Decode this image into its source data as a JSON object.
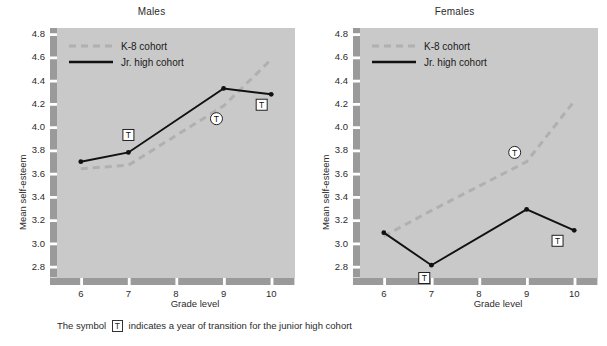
{
  "figure": {
    "caption_before": "The symbol",
    "caption_symbol": "T",
    "caption_after": "indicates a year of transition for the junior high cohort"
  },
  "colors": {
    "plot_background": "#c9c9c9",
    "axis_band": "#9a9a9a",
    "k8_line": "#b0b0b0",
    "jrhigh_line": "#111111",
    "text": "#2b2b2b"
  },
  "chart_data": [
    {
      "type": "line",
      "title": "Males",
      "xlabel": "Grade level",
      "ylabel": "Mean self-esteem",
      "x": [
        6,
        7,
        8,
        9,
        10
      ],
      "xtick_labels": [
        "6",
        "7",
        "8",
        "9",
        "10"
      ],
      "xlim": [
        5.5,
        10.5
      ],
      "ylim": [
        2.7,
        4.85
      ],
      "ytick_labels": [
        "2.8",
        "3.0",
        "3.2",
        "3.4",
        "3.6",
        "3.8",
        "4.0",
        "4.2",
        "4.4",
        "4.6",
        "4.8"
      ],
      "yticks": [
        2.8,
        3.0,
        3.2,
        3.4,
        3.6,
        3.8,
        4.0,
        4.2,
        4.4,
        4.6,
        4.8
      ],
      "grid": false,
      "legend_position": "upper-left",
      "series": [
        {
          "name": "K-8 cohort",
          "style": "dashed",
          "color": "#b0b0b0",
          "markers": false,
          "x": [
            6,
            7,
            9,
            10
          ],
          "values": [
            3.64,
            3.67,
            4.18,
            4.58
          ]
        },
        {
          "name": "Jr. high cohort",
          "style": "solid",
          "color": "#111111",
          "markers": true,
          "x": [
            6,
            7,
            9,
            10
          ],
          "values": [
            3.7,
            3.78,
            4.33,
            4.28
          ]
        }
      ],
      "transition_markers": [
        {
          "label": "T",
          "shape": "square",
          "x": 7.0,
          "y": 3.93
        },
        {
          "label": "T",
          "shape": "circle",
          "x": 8.85,
          "y": 4.07
        },
        {
          "label": "T",
          "shape": "square",
          "x": 9.8,
          "y": 4.19
        }
      ]
    },
    {
      "type": "line",
      "title": "Females",
      "xlabel": "Grade level",
      "ylabel": "Mean self-esteem",
      "x": [
        6,
        7,
        8,
        9,
        10
      ],
      "xtick_labels": [
        "6",
        "7",
        "8",
        "9",
        "10"
      ],
      "xlim": [
        5.5,
        10.5
      ],
      "ylim": [
        2.7,
        4.85
      ],
      "ytick_labels": [
        "2.8",
        "3.0",
        "3.2",
        "3.4",
        "3.6",
        "3.8",
        "4.0",
        "4.2",
        "4.4",
        "4.6",
        "4.8"
      ],
      "yticks": [
        2.8,
        3.0,
        3.2,
        3.4,
        3.6,
        3.8,
        4.0,
        4.2,
        4.4,
        4.6,
        4.8
      ],
      "grid": false,
      "legend_position": "upper-left",
      "series": [
        {
          "name": "K-8 cohort",
          "style": "dashed",
          "color": "#b0b0b0",
          "markers": false,
          "x": [
            6,
            7,
            9,
            10
          ],
          "values": [
            3.06,
            3.28,
            3.7,
            4.22
          ]
        },
        {
          "name": "Jr. high cohort",
          "style": "solid",
          "color": "#111111",
          "markers": true,
          "x": [
            6,
            7,
            9,
            10
          ],
          "values": [
            3.09,
            2.81,
            3.29,
            3.11
          ]
        }
      ],
      "transition_markers": [
        {
          "label": "T",
          "shape": "square",
          "x": 6.85,
          "y": 2.7
        },
        {
          "label": "T",
          "shape": "circle",
          "x": 8.75,
          "y": 3.78
        },
        {
          "label": "T",
          "shape": "square",
          "x": 9.65,
          "y": 3.02
        }
      ]
    }
  ]
}
